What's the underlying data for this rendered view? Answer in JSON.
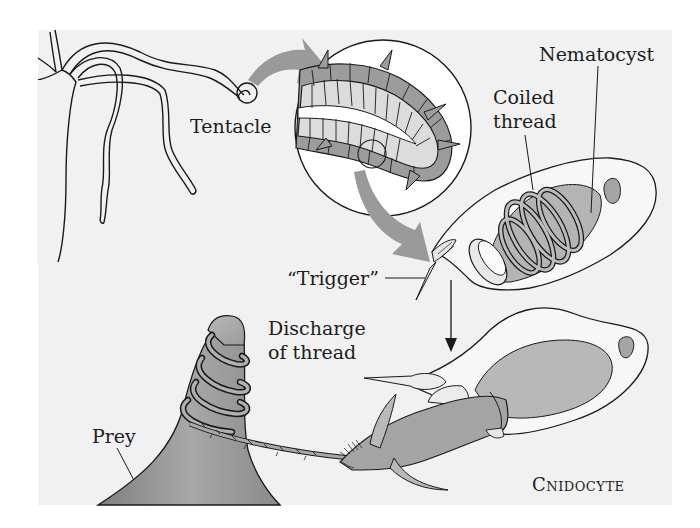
{
  "figure": {
    "title": "Cnidocyte",
    "background": "#f1f1f1",
    "labels": {
      "tentacle": "Tentacle",
      "nematocyst": "Nematocyst",
      "coiled_thread_line1": "Coiled",
      "coiled_thread_line2": "thread",
      "trigger": "“Trigger”",
      "discharge_line1": "Discharge",
      "discharge_line2": "of thread",
      "prey": "Prey",
      "cnidocyte": "Cnidocyte"
    },
    "colors": {
      "outline": "#1a1a1a",
      "arrow_gray": "#9a9a9a",
      "dark_fill": "#8f8f8f",
      "mid_fill": "#a9a9a9",
      "light_fill": "#d6d6d6",
      "cell_fill": "#f7f7f7"
    }
  }
}
